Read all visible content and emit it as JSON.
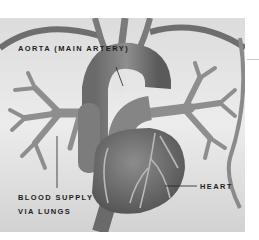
{
  "figure": {
    "style": "grayscale anatomical illustration",
    "labels": {
      "aorta": "AORTA (MAIN ARTERY)",
      "blood_supply_line1": "BLOOD SUPPLY",
      "blood_supply_line2": "VIA LUNGS",
      "heart": "HEART"
    },
    "colors": {
      "background": "#ffffff",
      "backdrop_light": "#e6e6e6",
      "vessel": "#8a8a8a",
      "vessel_dark": "#5e5e5e",
      "heart": "#707070",
      "label_text": "#1e1e1e"
    }
  }
}
